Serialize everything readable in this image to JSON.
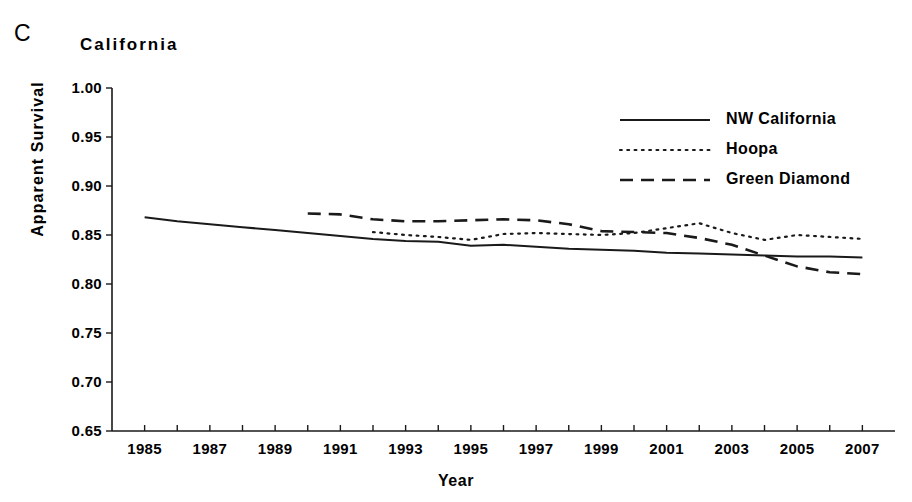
{
  "panel": {
    "label": "C"
  },
  "chart_data": {
    "type": "line",
    "title": "California",
    "xlabel": "Year",
    "ylabel": "Apparent Survival",
    "xlim": [
      1984,
      2008
    ],
    "ylim": [
      0.65,
      1.0
    ],
    "ytick_values": [
      1.0,
      0.95,
      0.9,
      0.85,
      0.8,
      0.75,
      0.7,
      0.65
    ],
    "ytick_labels": [
      "1.00",
      "0.95",
      "0.90",
      "0.85",
      "0.80",
      "0.75",
      "0.70",
      "0.65"
    ],
    "xtick_values": [
      1985,
      1987,
      1989,
      1991,
      1993,
      1995,
      1997,
      1999,
      2001,
      2003,
      2005,
      2007
    ],
    "xtick_labels": [
      "1985",
      "1987",
      "1989",
      "1991",
      "1993",
      "1995",
      "1997",
      "1999",
      "2001",
      "2003",
      "2005",
      "2007"
    ],
    "x_minor_ticks": [
      1985,
      1986,
      1987,
      1988,
      1989,
      1990,
      1991,
      1992,
      1993,
      1994,
      1995,
      1996,
      1997,
      1998,
      1999,
      2000,
      2001,
      2002,
      2003,
      2004,
      2005,
      2006,
      2007
    ],
    "grid": false,
    "legend_position": "top-right",
    "line_color": "#1a1a1a",
    "series": [
      {
        "name": "NW California",
        "style": "solid",
        "x": [
          1985,
          1986,
          1987,
          1988,
          1989,
          1990,
          1991,
          1992,
          1993,
          1994,
          1995,
          1996,
          1997,
          1998,
          1999,
          2000,
          2001,
          2002,
          2003,
          2004,
          2005,
          2006,
          2007
        ],
        "values": [
          0.868,
          0.864,
          0.861,
          0.858,
          0.855,
          0.852,
          0.849,
          0.846,
          0.844,
          0.843,
          0.839,
          0.84,
          0.838,
          0.836,
          0.835,
          0.834,
          0.832,
          0.831,
          0.83,
          0.829,
          0.828,
          0.828,
          0.827
        ]
      },
      {
        "name": "Hoopa",
        "style": "dotted",
        "x": [
          1992,
          1993,
          1994,
          1995,
          1996,
          1997,
          1998,
          1999,
          2000,
          2001,
          2002,
          2003,
          2004,
          2005,
          2006,
          2007
        ],
        "values": [
          0.853,
          0.85,
          0.848,
          0.845,
          0.851,
          0.852,
          0.851,
          0.85,
          0.852,
          0.857,
          0.862,
          0.852,
          0.845,
          0.85,
          0.848,
          0.846
        ]
      },
      {
        "name": "Green Diamond",
        "style": "dashed",
        "x": [
          1990,
          1991,
          1992,
          1993,
          1994,
          1995,
          1996,
          1997,
          1998,
          1999,
          2000,
          2001,
          2002,
          2003,
          2004,
          2005,
          2006,
          2007
        ],
        "values": [
          0.872,
          0.871,
          0.866,
          0.864,
          0.864,
          0.865,
          0.866,
          0.865,
          0.861,
          0.854,
          0.853,
          0.852,
          0.847,
          0.84,
          0.829,
          0.818,
          0.812,
          0.81
        ]
      }
    ]
  },
  "legend": {
    "items": [
      {
        "label": "NW California",
        "style": "solid"
      },
      {
        "label": "Hoopa",
        "style": "dotted"
      },
      {
        "label": "Green Diamond",
        "style": "dashed"
      }
    ]
  }
}
